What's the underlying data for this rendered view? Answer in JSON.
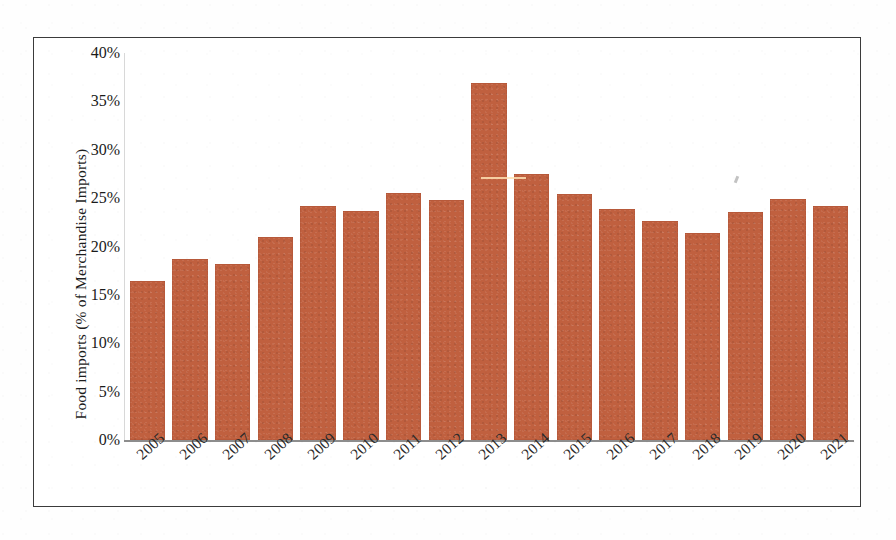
{
  "chart_data": {
    "type": "bar",
    "title": "",
    "xlabel": "",
    "ylabel": "Food imports (% of Merchandise Imports)",
    "categories": [
      "2005",
      "2006",
      "2007",
      "2008",
      "2009",
      "2010",
      "2011",
      "2012",
      "2013",
      "2014",
      "2015",
      "2016",
      "2017",
      "2018",
      "2019",
      "2020",
      "2021"
    ],
    "values": [
      16.4,
      18.7,
      18.2,
      21.0,
      24.2,
      23.7,
      25.5,
      24.8,
      36.9,
      27.5,
      25.4,
      23.9,
      22.6,
      21.4,
      23.6,
      24.9,
      24.2
    ],
    "value_labels": [
      "16.4%",
      "18.7%",
      "18.2%",
      "21.0%",
      "24.2%",
      "23.7%",
      "25.5%",
      "24.8%",
      "36.9%",
      "27.5%",
      "25.4%",
      "23.9%",
      "22.6%",
      "21.4%",
      "23.6%",
      "24.9%",
      "24.2%"
    ],
    "ylim": [
      0,
      40
    ],
    "ytick_values": [
      0,
      5,
      10,
      15,
      20,
      25,
      30,
      35,
      40
    ],
    "ytick_labels": [
      "0%",
      "5%",
      "10%",
      "15%",
      "20%",
      "25%",
      "30%",
      "35%",
      "40%"
    ],
    "grid": false,
    "legend": null,
    "bar_color": "#c0603f",
    "axis_color": "#8d8d8d",
    "frame_color": "#3b3b3b",
    "xtick_rotation": -42
  }
}
